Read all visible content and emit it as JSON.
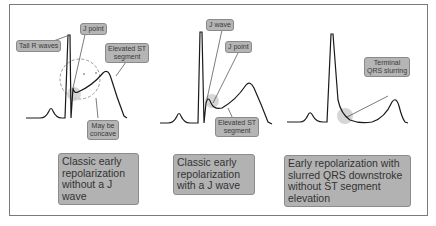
{
  "colors": {
    "frame": "#7a7a7a",
    "label_bg": "#b5b5b5",
    "caption_bg": "#b2b2b2",
    "trace": "#1a1a1a",
    "highlight": "#c8c8c8"
  },
  "panels": [
    {
      "id": "panel-1",
      "annotations": {
        "tall_r_waves": "Tall R waves",
        "j_point": "J point",
        "elevated_st_1": "Elevated ST",
        "elevated_st_2": "segment",
        "concave_1": "May be",
        "concave_2": "concave"
      },
      "caption": [
        "Classic early",
        "repolarization",
        "without a J wave"
      ]
    },
    {
      "id": "panel-2",
      "annotations": {
        "j_wave": "J wave",
        "j_point": "J point",
        "elevated_st_1": "Elevated ST",
        "elevated_st_2": "segment"
      },
      "caption": [
        "Classic early",
        "repolarization",
        "with a J wave"
      ]
    },
    {
      "id": "panel-3",
      "annotations": {
        "terminal_1": "Terminal",
        "terminal_2": "QRS slurring"
      },
      "caption": [
        "Early repolarization with",
        "slurred QRS downstroke",
        "without ST segment",
        "elevation"
      ]
    }
  ]
}
